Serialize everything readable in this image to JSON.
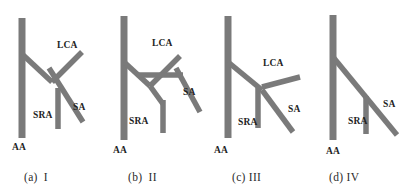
{
  "figure": {
    "type": "anatomical-variant-diagram",
    "vessel_color": "#7a7a7a",
    "text_color": "#232323",
    "background": "#ffffff",
    "width": 407,
    "height": 196,
    "label_glossary": {
      "AA": "Abdominal Aorta",
      "LCA": "Left Colic Artery",
      "SRA": "Superior Rectal Artery",
      "SA": "Sigmoid Artery"
    }
  },
  "panels": [
    {
      "id": "a",
      "caption_prefix": "(a)",
      "caption_roman": "I",
      "caption_full": "(a) I",
      "labels": [
        {
          "text": "LCA",
          "x": 57,
          "y": 41
        },
        {
          "text": "SRA",
          "x": 33,
          "y": 111
        },
        {
          "text": "SA",
          "x": 73,
          "y": 103
        },
        {
          "text": "AA",
          "x": 12,
          "y": 143
        }
      ]
    },
    {
      "id": "b",
      "caption_prefix": "(b)",
      "caption_roman": "II",
      "caption_full": "(b) II",
      "labels": [
        {
          "text": "LCA",
          "x": 152,
          "y": 39
        },
        {
          "text": "SRA",
          "x": 129,
          "y": 117
        },
        {
          "text": "SA",
          "x": 183,
          "y": 88
        },
        {
          "text": "AA",
          "x": 113,
          "y": 146
        }
      ]
    },
    {
      "id": "c",
      "caption_prefix": "(c)",
      "caption_roman": "III",
      "caption_full": "(c)III",
      "labels": [
        {
          "text": "LCA",
          "x": 263,
          "y": 59
        },
        {
          "text": "SRA",
          "x": 238,
          "y": 118
        },
        {
          "text": "SA",
          "x": 288,
          "y": 105
        },
        {
          "text": "AA",
          "x": 214,
          "y": 146
        }
      ]
    },
    {
      "id": "d",
      "caption_prefix": "(d)",
      "caption_roman": "IV",
      "caption_full": "(d)IV",
      "labels": [
        {
          "text": "SRA",
          "x": 348,
          "y": 117
        },
        {
          "text": "SA",
          "x": 383,
          "y": 100
        },
        {
          "text": "AA",
          "x": 326,
          "y": 147
        }
      ]
    }
  ],
  "captions": [
    {
      "prefix": "(a)",
      "roman": "I",
      "x": 24,
      "y": 172
    },
    {
      "prefix": "(b)",
      "roman": "II",
      "x": 128,
      "y": 172
    },
    {
      "prefix": "(c)",
      "roman": "III",
      "x": 232,
      "y": 172
    },
    {
      "prefix": "(d)",
      "roman": "IV",
      "x": 329,
      "y": 172
    }
  ]
}
